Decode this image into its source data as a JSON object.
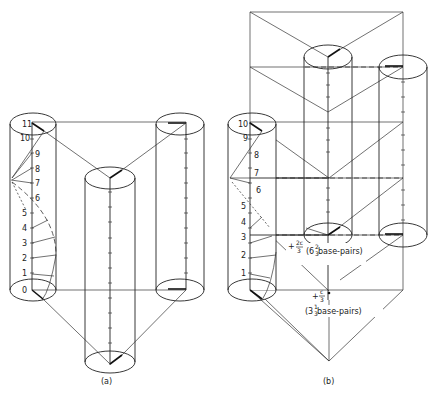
{
  "figure": {
    "panel_a": {
      "caption": "(a)",
      "ladder_labels": [
        "0",
        "1",
        "2",
        "3",
        "4",
        "5",
        "6",
        "7",
        "8",
        "9",
        "10",
        "11"
      ]
    },
    "panel_b": {
      "caption": "(b)",
      "ladder_labels": [
        "1",
        "2",
        "3",
        "4",
        "5",
        "6",
        "7",
        "8",
        "9",
        "10"
      ],
      "annotation_upper_prefix": "+",
      "annotation_upper_num": "2c",
      "annotation_upper_den": "3",
      "annotation_upper_text": "(6",
      "annotation_upper_frac_num": "2",
      "annotation_upper_frac_den": "3",
      "annotation_upper_suffix": " base-pairs)",
      "annotation_lower_prefix": "+",
      "annotation_lower_num": "c",
      "annotation_lower_den": "3",
      "annotation_lower_text": "(3",
      "annotation_lower_frac_num": "1",
      "annotation_lower_frac_den": "3",
      "annotation_lower_suffix": " base-pairs)"
    }
  }
}
